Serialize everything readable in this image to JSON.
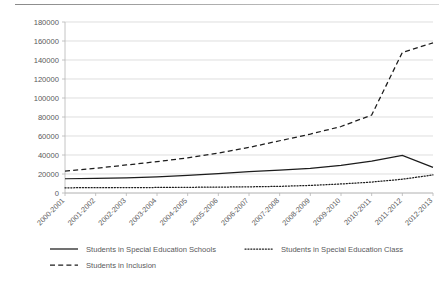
{
  "chart_data": {
    "type": "line",
    "title": "",
    "xlabel": "",
    "ylabel": "",
    "ylim": [
      0,
      180000
    ],
    "ytick_step": 20000,
    "grid": true,
    "legend_position": "bottom",
    "categories": [
      "2000-2001",
      "2001-2002",
      "2002-2003",
      "2003-2004",
      "2004-2005",
      "2005-2006",
      "2006-2007",
      "2007-2008",
      "2008-2009",
      "2009-2010",
      "2010-2011",
      "2011-2012",
      "2012-2013"
    ],
    "ytick_labels": [
      "0",
      "20000",
      "40000",
      "60000",
      "80000",
      "100000",
      "120000",
      "140000",
      "160000",
      "180000"
    ],
    "series": [
      {
        "name": "Students in Special Education Schools",
        "style": "solid",
        "values": [
          15000,
          15500,
          16000,
          17000,
          18500,
          20500,
          22500,
          24000,
          26000,
          29000,
          33500,
          39500,
          27000
        ]
      },
      {
        "name": "Students in Special Education Class",
        "style": "dotted",
        "values": [
          5500,
          5600,
          5700,
          5800,
          6000,
          6200,
          6500,
          7000,
          8000,
          9500,
          11500,
          14500,
          19000
        ]
      },
      {
        "name": "Students in Inclusion",
        "style": "dashed",
        "values": [
          23000,
          26000,
          29500,
          33000,
          37000,
          42000,
          48000,
          55000,
          62000,
          70000,
          82000,
          148000,
          158000
        ]
      }
    ]
  },
  "legend": {
    "items": [
      {
        "label": "Students in Special Education Schools",
        "style": "solid"
      },
      {
        "label": "Students in Special Education Class",
        "style": "dotted"
      },
      {
        "label": "Students in Inclusion",
        "style": "dashed"
      }
    ]
  }
}
